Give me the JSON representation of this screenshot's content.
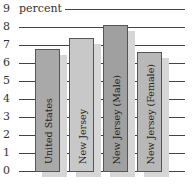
{
  "chart_data": {
    "type": "bar",
    "title": "",
    "unit_label": "percent",
    "xlabel": "",
    "ylabel": "percent",
    "ylim": [
      0,
      9
    ],
    "yticks": [
      0,
      1,
      2,
      3,
      4,
      5,
      6,
      7,
      8,
      9
    ],
    "grid": true,
    "legend": "none",
    "categories": [
      "United States",
      "New Jersey",
      "New Jersey (Male)",
      "New Jersey (Female)"
    ],
    "values": [
      6.8,
      7.4,
      8.1,
      6.6
    ],
    "colors": [
      "#a9a9a9",
      "#c8c8c8",
      "#a0a0a0",
      "#b8b8b8"
    ]
  },
  "axis": {
    "ticks": [
      "0",
      "1",
      "2",
      "3",
      "4",
      "5",
      "6",
      "7",
      "8",
      "9"
    ],
    "unit": "percent"
  }
}
